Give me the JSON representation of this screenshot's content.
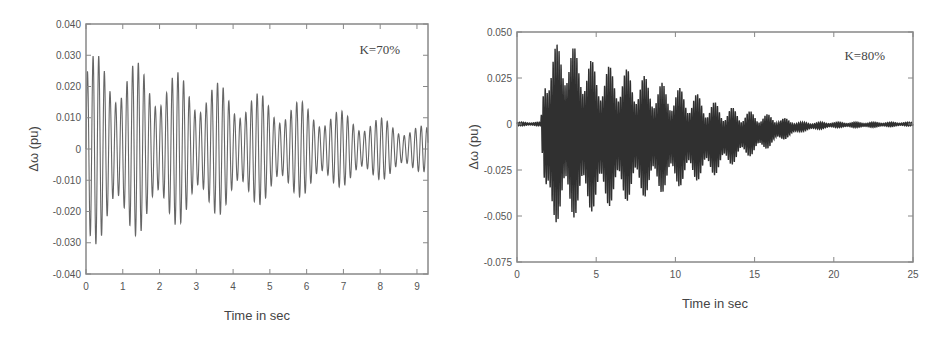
{
  "chart_data": [
    {
      "type": "line",
      "title": "",
      "annotation": "K=70%",
      "xlabel": "Time in sec",
      "ylabel": "Δω (pu)",
      "xlim": [
        0,
        9.3
      ],
      "ylim": [
        -0.04,
        0.04
      ],
      "xticks": [
        0,
        1,
        2,
        3,
        4,
        5,
        6,
        7,
        8,
        9
      ],
      "xtick_labels": [
        "0",
        "1",
        "2",
        "3",
        "4",
        "5",
        "6",
        "7",
        "8",
        "9"
      ],
      "yticks": [
        0.04,
        0.03,
        0.02,
        0.01,
        0,
        -0.01,
        -0.02,
        -0.03,
        -0.04
      ],
      "ytick_labels": [
        "0.040",
        "0.030",
        "0.020",
        "0.010",
        "0",
        "-0.010",
        "-0.020",
        "-0.030",
        "-0.040"
      ],
      "grid": false,
      "legend": null,
      "envelope_is_estimate": true,
      "envelope_note": "Approximate peak/trough envelope read visually from a dense oscillation; individual cycles not recoverable.",
      "series": [
        {
          "name": "Δω (K=70%)",
          "description": "Sustained oscillation with slowly decaying amplitude",
          "envelope_t": [
            0,
            1,
            2,
            3,
            4,
            5,
            6,
            7,
            8,
            9.3
          ],
          "envelope_upper": [
            0.031,
            0.029,
            0.026,
            0.023,
            0.02,
            0.017,
            0.015,
            0.012,
            0.01,
            0.007
          ],
          "envelope_lower": [
            -0.031,
            -0.029,
            -0.026,
            -0.023,
            -0.02,
            -0.017,
            -0.015,
            -0.012,
            -0.01,
            -0.007
          ]
        }
      ],
      "render": {
        "oscillation_hz_assumed": 6.5,
        "oscillation_note": "Frequency chosen for visual density only; not measured from the image.",
        "color": "#555555"
      }
    },
    {
      "type": "line",
      "title": "",
      "annotation": "K=80%",
      "xlabel": "Time in sec",
      "ylabel": "Δω (pu)",
      "xlim": [
        0,
        25
      ],
      "ylim": [
        -0.075,
        0.05
      ],
      "xticks": [
        0,
        5,
        10,
        15,
        20,
        25
      ],
      "xtick_labels": [
        "0",
        "5",
        "10",
        "15",
        "20",
        "25"
      ],
      "yticks": [
        0.05,
        0.025,
        0,
        -0.025,
        -0.05,
        -0.075
      ],
      "ytick_labels": [
        "0.050",
        "0.025",
        "0",
        "-0.025",
        "-0.050",
        "-0.075"
      ],
      "grid": false,
      "legend": null,
      "envelope_is_estimate": true,
      "envelope_note": "Approximate peak/trough envelope read visually from a dense oscillation; individual cycles not recoverable.",
      "series": [
        {
          "name": "Δω (K=80%)",
          "description": "Flat near 0 until ~1.7 s, then a large oscillation decaying to a small residual after ~18 s",
          "envelope_t": [
            0,
            1.5,
            1.8,
            3,
            5,
            7,
            9,
            11,
            12.5,
            14,
            15.5,
            16.5,
            18,
            20,
            22,
            25
          ],
          "envelope_upper": [
            0.001,
            0.001,
            0.04,
            0.046,
            0.033,
            0.03,
            0.023,
            0.018,
            0.012,
            0.008,
            0.006,
            0.004,
            0.001,
            0.001,
            0.001,
            0.001
          ],
          "envelope_lower": [
            -0.001,
            -0.001,
            -0.055,
            -0.053,
            -0.047,
            -0.042,
            -0.038,
            -0.032,
            -0.028,
            -0.02,
            -0.015,
            -0.01,
            -0.004,
            -0.002,
            -0.002,
            -0.001
          ]
        }
      ],
      "render": {
        "oscillation_hz_assumed": 8,
        "oscillation_note": "Frequency chosen for visual density only; not measured from the image.",
        "color": "#1a1a1a"
      }
    }
  ]
}
